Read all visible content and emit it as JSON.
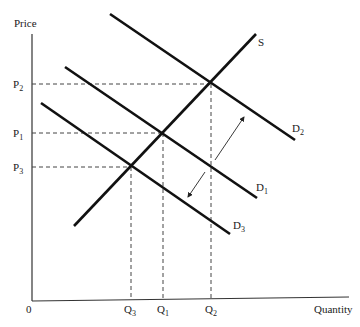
{
  "diagram": {
    "axes": {
      "y_label": "Price",
      "x_label": "Quantity",
      "origin_label": "0"
    },
    "price_ticks": [
      {
        "base": "P",
        "sub": "2",
        "y": 84
      },
      {
        "base": "P",
        "sub": "1",
        "y": 133
      },
      {
        "base": "P",
        "sub": "3",
        "y": 167
      }
    ],
    "quantity_ticks": [
      {
        "base": "Q",
        "sub": "3",
        "x": 131
      },
      {
        "base": "Q",
        "sub": "1",
        "x": 163
      },
      {
        "base": "Q",
        "sub": "2",
        "x": 211
      }
    ],
    "curves": [
      {
        "name": "S",
        "label": "S",
        "sub": ""
      },
      {
        "name": "D2",
        "label": "D",
        "sub": "2"
      },
      {
        "name": "D1",
        "label": "D",
        "sub": "1"
      },
      {
        "name": "D3",
        "label": "D",
        "sub": "3"
      }
    ],
    "shifts": [
      {
        "direction": "increase",
        "from": "D1",
        "to": "D2"
      },
      {
        "direction": "decrease",
        "from": "D1",
        "to": "D3"
      }
    ]
  }
}
